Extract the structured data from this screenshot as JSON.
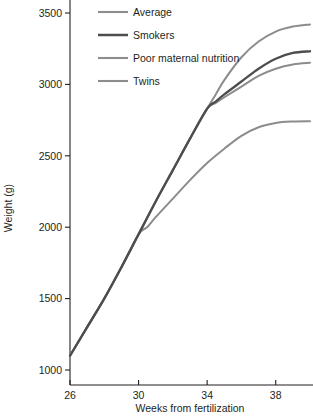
{
  "chart_data": {
    "type": "line",
    "title": "",
    "xlabel": "Weeks from fertilization",
    "ylabel": "Weight (g)",
    "xlim": [
      26,
      40
    ],
    "ylim": [
      850,
      3600
    ],
    "xticks": [
      26,
      30,
      34,
      38
    ],
    "yticks": [
      1000,
      1500,
      2000,
      2500,
      3000,
      3500
    ],
    "xtick_labels": [
      "26",
      "30",
      "34",
      "38"
    ],
    "ytick_labels": [
      "1000",
      "1500",
      "2000",
      "2500",
      "3000",
      "3500"
    ],
    "grid": false,
    "legend_position": "top-left-inside",
    "series": [
      {
        "name": "Average",
        "color": "#8c8c8c",
        "x": [
          26,
          27,
          28,
          29,
          30,
          31,
          32,
          33,
          34,
          34.5,
          35,
          36,
          37,
          38,
          39,
          40
        ],
        "values": [
          1100,
          1300,
          1500,
          1720,
          1950,
          2180,
          2400,
          2620,
          2830,
          2930,
          3030,
          3190,
          3300,
          3370,
          3405,
          3420
        ]
      },
      {
        "name": "Smokers",
        "color": "#4d4d4d",
        "x": [
          26,
          27,
          28,
          29,
          30,
          31,
          32,
          33,
          34,
          34.5,
          35,
          36,
          37,
          38,
          39,
          40
        ],
        "values": [
          1100,
          1300,
          1500,
          1720,
          1950,
          2180,
          2400,
          2620,
          2830,
          2880,
          2930,
          3020,
          3110,
          3180,
          3220,
          3232
        ]
      },
      {
        "name": "Poor maternal nutrition",
        "color": "#8c8c8c",
        "x": [
          26,
          27,
          28,
          29,
          30,
          31,
          32,
          33,
          34,
          34.5,
          35,
          36,
          37,
          38,
          39,
          40
        ],
        "values": [
          1100,
          1300,
          1500,
          1720,
          1950,
          2180,
          2400,
          2620,
          2830,
          2870,
          2910,
          2985,
          3060,
          3110,
          3140,
          3152
        ]
      },
      {
        "name": "Twins",
        "color": "#8c8c8c",
        "x": [
          26,
          27,
          28,
          29,
          30,
          30.5,
          31,
          32,
          33,
          34,
          35,
          36,
          37,
          38,
          39,
          40
        ],
        "values": [
          1100,
          1300,
          1500,
          1720,
          1950,
          2000,
          2070,
          2200,
          2330,
          2450,
          2550,
          2640,
          2700,
          2730,
          2740,
          2742
        ]
      }
    ],
    "legend_entries": [
      {
        "label": "Average",
        "color": "#8c8c8c"
      },
      {
        "label": "Smokers",
        "color": "#4d4d4d"
      },
      {
        "label": "Poor maternal nutrition",
        "color": "#8c8c8c"
      },
      {
        "label": "Twins",
        "color": "#8c8c8c"
      }
    ]
  }
}
